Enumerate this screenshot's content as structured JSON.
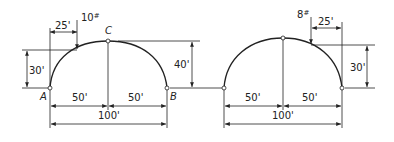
{
  "diagrams": [
    {
      "id": "left-arch",
      "points": {
        "A": "A",
        "B": "B",
        "C": "C"
      },
      "load": {
        "value": "10",
        "unit": "#"
      },
      "dimensions": {
        "load_from_left": "25'",
        "load_height": "30'",
        "rise": "40'",
        "half_span_left": "50'",
        "half_span_right": "50'",
        "span": "100'"
      }
    },
    {
      "id": "right-arch",
      "load": {
        "value": "8",
        "unit": "#"
      },
      "dimensions": {
        "load_from_right": "25'",
        "load_height": "30'",
        "half_span_left": "50'",
        "half_span_right": "50'",
        "span": "100'"
      }
    }
  ]
}
